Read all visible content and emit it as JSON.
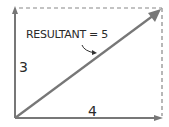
{
  "diagram": {
    "title": "",
    "labels": {
      "resultant": "RESULTANT = 5",
      "vertical": "3",
      "horizontal": "4"
    },
    "colors": {
      "line": "#777777",
      "dashed": "#888888",
      "text": "#2a2a2a"
    },
    "vectors": [
      {
        "name": "vertical",
        "magnitude": 3
      },
      {
        "name": "horizontal",
        "magnitude": 4
      },
      {
        "name": "resultant",
        "magnitude": 5
      }
    ]
  }
}
